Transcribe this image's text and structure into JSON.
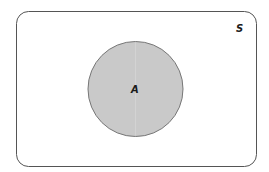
{
  "diagram": {
    "type": "venn",
    "universe": {
      "label": "S"
    },
    "sets": [
      {
        "label": "A",
        "shaded": true
      }
    ]
  },
  "colors": {
    "background": "#ffffff",
    "universe_stroke": "#555555",
    "set_fill": "#c9c9c9",
    "set_stroke": "#777777",
    "label": "#1a1a1a"
  }
}
